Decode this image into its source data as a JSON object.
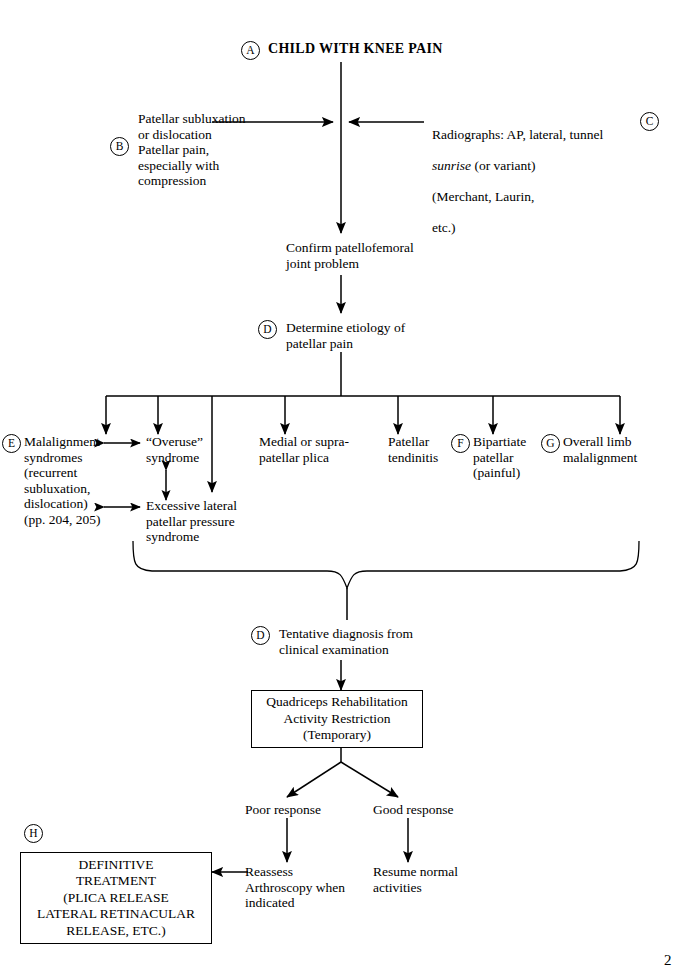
{
  "document": {
    "kind": "clinical-algorithm-flowchart",
    "page_number": "2"
  },
  "tags": {
    "a": "A",
    "b": "B",
    "c": "C",
    "d1": "D",
    "e": "E",
    "f": "F",
    "g": "G",
    "d2": "D",
    "h": "H"
  },
  "nodes": {
    "root": "CHILD WITH KNEE PAIN",
    "left_input": "Patellar subluxation\nor dislocation\nPatellar pain,\nespecially with\ncompression",
    "right_input_line1": "Radiographs: AP, lateral, tunnel",
    "right_input_italic": "sunrise",
    "right_input_line2_rest": " (or variant)",
    "right_input_line3": "(Merchant, Laurin,",
    "right_input_line4": "etc.)",
    "confirm": "Confirm patellofemoral\njoint problem",
    "determine": "Determine etiology of\npatellar pain",
    "branch_malalignment": "Malalignment\nsyndromes\n(recurrent\nsubluxation,\ndislocation)\n(pp. 204, 205)",
    "branch_overuse": "“Overuse”\nsyndrome",
    "branch_excessive": "Excessive lateral\npatellar pressure\nsyndrome",
    "branch_plica": "Medial or supra-\npatellar plica",
    "branch_tendinitis": "Patellar\ntendinitis",
    "branch_bipartiate": "Bipartiate\npatellar\n(painful)",
    "branch_overall_limb": "Overall limb\nmalalignment",
    "tentative": "Tentative diagnosis from\nclinical examination",
    "rehab_box": "Quadriceps Rehabilitation\nActivity Restriction\n(Temporary)",
    "poor_response": "Poor response",
    "good_response": "Good response",
    "reassess": "Reassess\nArthroscopy when\nindicated",
    "resume": "Resume normal\nactivities",
    "definitive_box": "DEFINITIVE\nTREATMENT\n(PLICA RELEASE\nLATERAL RETINACULAR\nRELEASE, ETC.)"
  },
  "colors": {
    "ink": "#000000",
    "paper": "#ffffff"
  }
}
